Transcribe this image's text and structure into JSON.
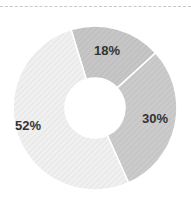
{
  "chart_data": {
    "type": "pie",
    "variant": "donut",
    "title": "",
    "categories": [
      "Segment A",
      "Segment B",
      "Segment C"
    ],
    "values": [
      18,
      30,
      52
    ],
    "labels": [
      "18%",
      "30%",
      "52%"
    ],
    "colors": [
      "#c4c4c4",
      "#c9c9c9",
      "#ebebeb"
    ],
    "legend": "none",
    "start_angle_deg": -17,
    "direction": "clockwise"
  }
}
